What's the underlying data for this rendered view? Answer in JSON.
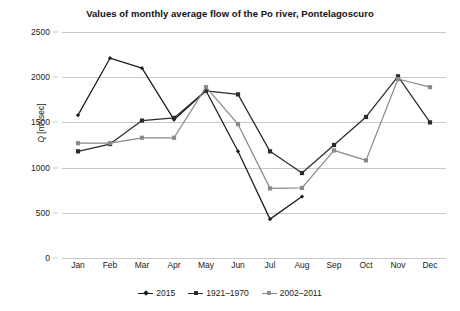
{
  "chart_data": {
    "type": "line",
    "title": "Values of monthly average flow of the Po river, Pontelagoscuro",
    "xlabel": "",
    "ylabel": "Q [m³/sec]",
    "categories": [
      "Jan",
      "Feb",
      "Mar",
      "Apr",
      "May",
      "Jun",
      "Jul",
      "Aug",
      "Sep",
      "Oct",
      "Nov",
      "Dec"
    ],
    "ylim": [
      0,
      2500
    ],
    "yticks": [
      0,
      500,
      1000,
      1500,
      2000,
      2500
    ],
    "ytick_labels": [
      "0",
      "500",
      "1000",
      "1500",
      "2000",
      "2500"
    ],
    "grid": "horizontal",
    "legend_position": "bottom",
    "series": [
      {
        "name": "2015",
        "color": "#1c1c1c",
        "marker": "diamond",
        "values": [
          1580,
          2210,
          2100,
          1530,
          1850,
          1180,
          430,
          680,
          null,
          null,
          null,
          null
        ]
      },
      {
        "name": "1921–1970",
        "color": "#2b2b2b",
        "marker": "square",
        "values": [
          1180,
          1260,
          1520,
          1550,
          1850,
          1810,
          1180,
          940,
          1250,
          1560,
          2010,
          1500
        ]
      },
      {
        "name": "2002–2011",
        "color": "#8a8a8a",
        "marker": "square",
        "values": [
          1270,
          1270,
          1330,
          1330,
          1890,
          1480,
          770,
          775,
          1190,
          1080,
          1980,
          1890
        ]
      }
    ]
  },
  "colors": {
    "background": "#ffffff",
    "gridline": "#c9c9c9",
    "text": "#1a1a1a"
  }
}
